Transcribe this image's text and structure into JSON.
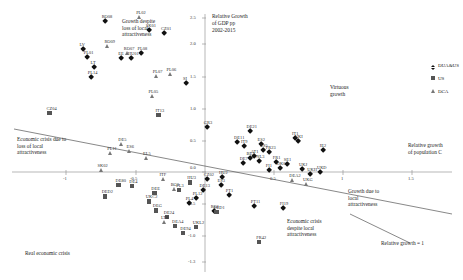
{
  "chart_data": {
    "type": "scatter",
    "title": "",
    "ylabel": "Relative Growth\nof GDP pp\n2002-2015",
    "xlabel": "Relative growth\nof population C",
    "xlim": [
      -1.25,
      1.85
    ],
    "ylim": [
      -1.35,
      2.6
    ],
    "grid": false,
    "legend_position": "right",
    "yticks": [
      "2.5",
      "2.0",
      "1.5",
      "1.0",
      "0.5",
      "0.0",
      "-0.5",
      "-1.0",
      "-1.3"
    ],
    "ytick_values": [
      2.5,
      2.0,
      1.5,
      1.0,
      0.5,
      0.0,
      -0.5,
      -1.0,
      -1.3
    ],
    "xticks": [
      "-1",
      "-0.5",
      "0.5",
      "1",
      "1.5"
    ],
    "xtick_values": [
      -1,
      -0.5,
      0.5,
      1,
      1.5
    ],
    "series": [
      {
        "name": "DUA&US",
        "marker": "diamond",
        "color": "#111111",
        "points": [
          {
            "label": "RO08",
            "x": -0.72,
            "y": 2.36
          },
          {
            "label": "SK01",
            "x": -0.4,
            "y": 2.22
          },
          {
            "label": "CZ01",
            "x": -0.29,
            "y": 2.18
          },
          {
            "label": "LV",
            "x": -0.88,
            "y": 1.92
          },
          {
            "label": "PL01",
            "x": -0.85,
            "y": 1.8
          },
          {
            "label": "PL08",
            "x": -0.46,
            "y": 1.86
          },
          {
            "label": "EE",
            "x": -0.6,
            "y": 1.78
          },
          {
            "label": "HU01",
            "x": -0.53,
            "y": 1.78
          },
          {
            "label": "LT",
            "x": -0.8,
            "y": 1.63
          },
          {
            "label": "PL14",
            "x": -0.82,
            "y": 1.48
          },
          {
            "label": "SI",
            "x": -0.13,
            "y": 1.38
          },
          {
            "label": "GR3",
            "x": 0.02,
            "y": 0.7
          },
          {
            "label": "DE21",
            "x": 0.33,
            "y": 0.63
          },
          {
            "label": "IT1",
            "x": 0.66,
            "y": 0.52
          },
          {
            "label": "DE11",
            "x": 0.24,
            "y": 0.45
          },
          {
            "label": "IT9",
            "x": 0.29,
            "y": 0.4
          },
          {
            "label": "ES2",
            "x": 0.41,
            "y": 0.43
          },
          {
            "label": "ES5",
            "x": 0.43,
            "y": 0.33
          },
          {
            "label": "FR23",
            "x": 0.47,
            "y": 0.3
          },
          {
            "label": "IE2",
            "x": 0.86,
            "y": 0.33
          },
          {
            "label": "UKI",
            "x": 0.68,
            "y": 0.47
          },
          {
            "label": "AT1",
            "x": 0.36,
            "y": 0.24
          },
          {
            "label": "BE2",
            "x": 0.33,
            "y": 0.2
          },
          {
            "label": "NL3",
            "x": 0.4,
            "y": 0.16
          },
          {
            "label": "FR1",
            "x": 0.52,
            "y": 0.14
          },
          {
            "label": "DE7",
            "x": 0.28,
            "y": 0.12
          },
          {
            "label": "SE1",
            "x": 0.6,
            "y": 0.11
          },
          {
            "label": "DK0",
            "x": 0.55,
            "y": 0.05
          },
          {
            "label": "FI1",
            "x": 0.47,
            "y": 0.02
          },
          {
            "label": "UKJ",
            "x": 0.71,
            "y": 0.03
          },
          {
            "label": "UKH",
            "x": 0.77,
            "y": -0.05
          },
          {
            "label": "UKD",
            "x": 0.84,
            "y": -0.02
          },
          {
            "label": "PT1",
            "x": 0.18,
            "y": -0.38
          },
          {
            "label": "PT11",
            "x": 0.36,
            "y": -0.55
          },
          {
            "label": "FI19",
            "x": 0.57,
            "y": -0.58
          },
          {
            "label": "ES3",
            "x": 0.12,
            "y": -0.22
          },
          {
            "label": "CZ02",
            "x": 0.02,
            "y": -0.12
          },
          {
            "label": "HU2",
            "x": 0.13,
            "y": -0.1
          },
          {
            "label": "DE13",
            "x": -0.01,
            "y": -0.3
          },
          {
            "label": "PL12",
            "x": -0.06,
            "y": -0.42
          },
          {
            "label": "PL4",
            "x": -0.11,
            "y": -0.5
          },
          {
            "label": "RO1",
            "x": 0.07,
            "y": -0.63
          }
        ]
      },
      {
        "name": "US",
        "marker": "square",
        "color": "#555555",
        "points": [
          {
            "label": "CZ04",
            "x": -1.12,
            "y": 0.92
          },
          {
            "label": "IT13",
            "x": -0.33,
            "y": 0.88
          },
          {
            "label": "DE80",
            "x": -0.62,
            "y": -0.22
          },
          {
            "label": "DED2",
            "x": -0.72,
            "y": -0.4
          },
          {
            "label": "DE4",
            "x": -0.52,
            "y": -0.24
          },
          {
            "label": "UKC2",
            "x": -0.4,
            "y": -0.48
          },
          {
            "label": "DEG",
            "x": -0.35,
            "y": -0.62
          },
          {
            "label": "DE24",
            "x": -0.27,
            "y": -0.72
          },
          {
            "label": "DEA4",
            "x": -0.21,
            "y": -0.86
          },
          {
            "label": "DE94",
            "x": -0.15,
            "y": -0.97
          },
          {
            "label": "UKL2",
            "x": -0.06,
            "y": -0.88
          },
          {
            "label": "DED1",
            "x": 0.09,
            "y": -0.64
          },
          {
            "label": "FR42",
            "x": 0.4,
            "y": -1.12
          },
          {
            "label": "DEE",
            "x": -0.36,
            "y": -0.34
          },
          {
            "label": "PL3",
            "x": -0.18,
            "y": -0.3
          },
          {
            "label": "HU3",
            "x": -0.1,
            "y": -0.18
          }
        ]
      },
      {
        "name": "DCA",
        "marker": "triangle",
        "color": "#777777",
        "points": [
          {
            "label": "PL02",
            "x": -0.47,
            "y": 2.42
          },
          {
            "label": "RO09",
            "x": -0.7,
            "y": 1.97
          },
          {
            "label": "RO07",
            "x": -0.56,
            "y": 1.86
          },
          {
            "label": "PL07",
            "x": -0.35,
            "y": 1.5
          },
          {
            "label": "PL06",
            "x": -0.25,
            "y": 1.52
          },
          {
            "label": "PL05",
            "x": -0.38,
            "y": 1.18
          },
          {
            "label": "DE5",
            "x": -0.6,
            "y": 0.42
          },
          {
            "label": "ES6",
            "x": -0.54,
            "y": 0.31
          },
          {
            "label": "PL11",
            "x": -0.68,
            "y": 0.28
          },
          {
            "label": "EL5",
            "x": -0.42,
            "y": 0.2
          },
          {
            "label": "SK02",
            "x": -0.75,
            "y": 0.02
          },
          {
            "label": "ITF",
            "x": -0.3,
            "y": -0.12
          },
          {
            "label": "BG3",
            "x": -0.22,
            "y": -0.28
          },
          {
            "label": "LT0",
            "x": -0.29,
            "y": -0.8
          },
          {
            "label": "DEA2",
            "x": 0.64,
            "y": -0.14
          },
          {
            "label": "UKG",
            "x": 0.74,
            "y": -0.2
          }
        ]
      }
    ],
    "annotations": [
      {
        "id": "growth-despite-loss",
        "text": "Growth despite\nloss of local\nattractiveness"
      },
      {
        "id": "virtuous-growth",
        "text": "Virtuous\ngrowth"
      },
      {
        "id": "economic-crisis-loss",
        "text": "Economic crisis due to\nloss of local\nattractiveness"
      },
      {
        "id": "growth-due-local",
        "text": "Growth due to\nlocal\nattractiveness"
      },
      {
        "id": "economic-crisis-despite",
        "text": "Economic crisis\ndespite local\nattractiveness"
      },
      {
        "id": "real-economic-crisis",
        "text": "Real economic crisis"
      },
      {
        "id": "relative-growth-one",
        "text": "Relative growth = 1"
      }
    ]
  },
  "legend": {
    "items": [
      {
        "label": "DUA&US",
        "marker": "diamond"
      },
      {
        "label": "US",
        "marker": "square"
      },
      {
        "label": "DCA",
        "marker": "triangle"
      }
    ]
  }
}
